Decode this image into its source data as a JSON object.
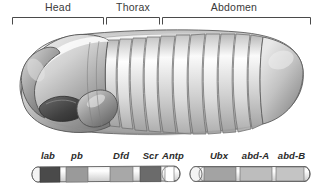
{
  "figure": {
    "background_color": "#ffffff",
    "line_color": "#4a4a4a"
  },
  "regions": {
    "bracket_color": "#4a4a4a",
    "items": [
      {
        "label": "Head",
        "x_start": 12,
        "x_end": 103,
        "label_center": 58,
        "label_top": 1
      },
      {
        "label": "Thorax",
        "x_start": 106,
        "x_end": 159,
        "label_center": 133,
        "label_top": 1
      },
      {
        "label": "Abdomen",
        "x_start": 162,
        "x_end": 311,
        "label_center": 234,
        "label_top": 1
      }
    ]
  },
  "embryo": {
    "name": "drosophila-embryo-illustration",
    "description": "Lateral view of a Drosophila larva/embryo showing segmented body",
    "body_fill_light": "#f2f2f2",
    "body_fill_mid": "#cfcfcf",
    "body_fill_dark": "#8e8e8e",
    "outline_color": "#5a5a5a",
    "segment_count": 11
  },
  "gene_complexes": [
    {
      "name": "Antennapedia complex",
      "bar_x": 32,
      "bar_width": 148,
      "bar_y": 167,
      "bar_height": 14,
      "genes": [
        {
          "label": "lab",
          "x": 38,
          "width": 20,
          "fill": "#4a4a4a",
          "label_center": 48,
          "label_top": 152
        },
        {
          "label": "pb",
          "x": 66,
          "width": 22,
          "fill": "#9a9a9a",
          "label_center": 77,
          "label_top": 152
        },
        {
          "label": "Dfd",
          "x": 110,
          "width": 23,
          "fill": "#a8a8a8",
          "label_center": 121,
          "label_top": 152
        },
        {
          "label": "Scr",
          "x": 140,
          "width": 21,
          "fill": "#6b6b6b",
          "label_center": 150,
          "label_top": 152
        },
        {
          "label": "Antp",
          "x": 164,
          "width": 16,
          "fill": "#ffffff",
          "label_center": 172,
          "label_top": 152
        }
      ]
    },
    {
      "name": "Bithorax complex",
      "bar_x": 190,
      "bar_width": 122,
      "bar_y": 167,
      "bar_height": 14,
      "genes": [
        {
          "label": "Ubx",
          "x": 204,
          "width": 32,
          "fill": "#a3a3a3",
          "label_center": 219,
          "label_top": 152
        },
        {
          "label": "abd-A",
          "x": 240,
          "width": 32,
          "fill": "#bdbdbd",
          "label_center": 255,
          "label_top": 152
        },
        {
          "label": "abd-B",
          "x": 276,
          "width": 34,
          "fill": "#c4c4c4",
          "label_center": 291,
          "label_top": 152
        }
      ]
    }
  ]
}
